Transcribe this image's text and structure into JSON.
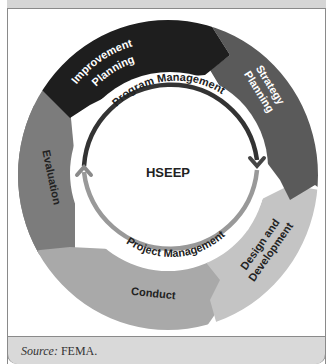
{
  "diagram": {
    "center_label": "HSEEP",
    "inner_arcs": {
      "top": "Program Management",
      "bottom": "Project Management"
    },
    "segments": [
      {
        "id": "improvement-planning",
        "label_lines": [
          "Improvement",
          "Planning"
        ],
        "color": "#1e1e1e",
        "text_color": "#ffffff"
      },
      {
        "id": "strategy-planning",
        "label_lines": [
          "Strategy",
          "Planning"
        ],
        "color": "#5a5a5a",
        "text_color": "#ffffff"
      },
      {
        "id": "design-and-development",
        "label_lines": [
          "Design and",
          "Development"
        ],
        "color": "#c4c4c4",
        "text_color": "#222222"
      },
      {
        "id": "conduct",
        "label_lines": [
          "Conduct"
        ],
        "color": "#a9a9a9",
        "text_color": "#222222"
      },
      {
        "id": "evaluation",
        "label_lines": [
          "Evaluation"
        ],
        "color": "#7c7c7c",
        "text_color": "#222222"
      }
    ],
    "arc_colors": {
      "program": "#333333",
      "project": "#999999"
    }
  },
  "footer": {
    "source_label": "Source:",
    "source_value": " FEMA."
  }
}
